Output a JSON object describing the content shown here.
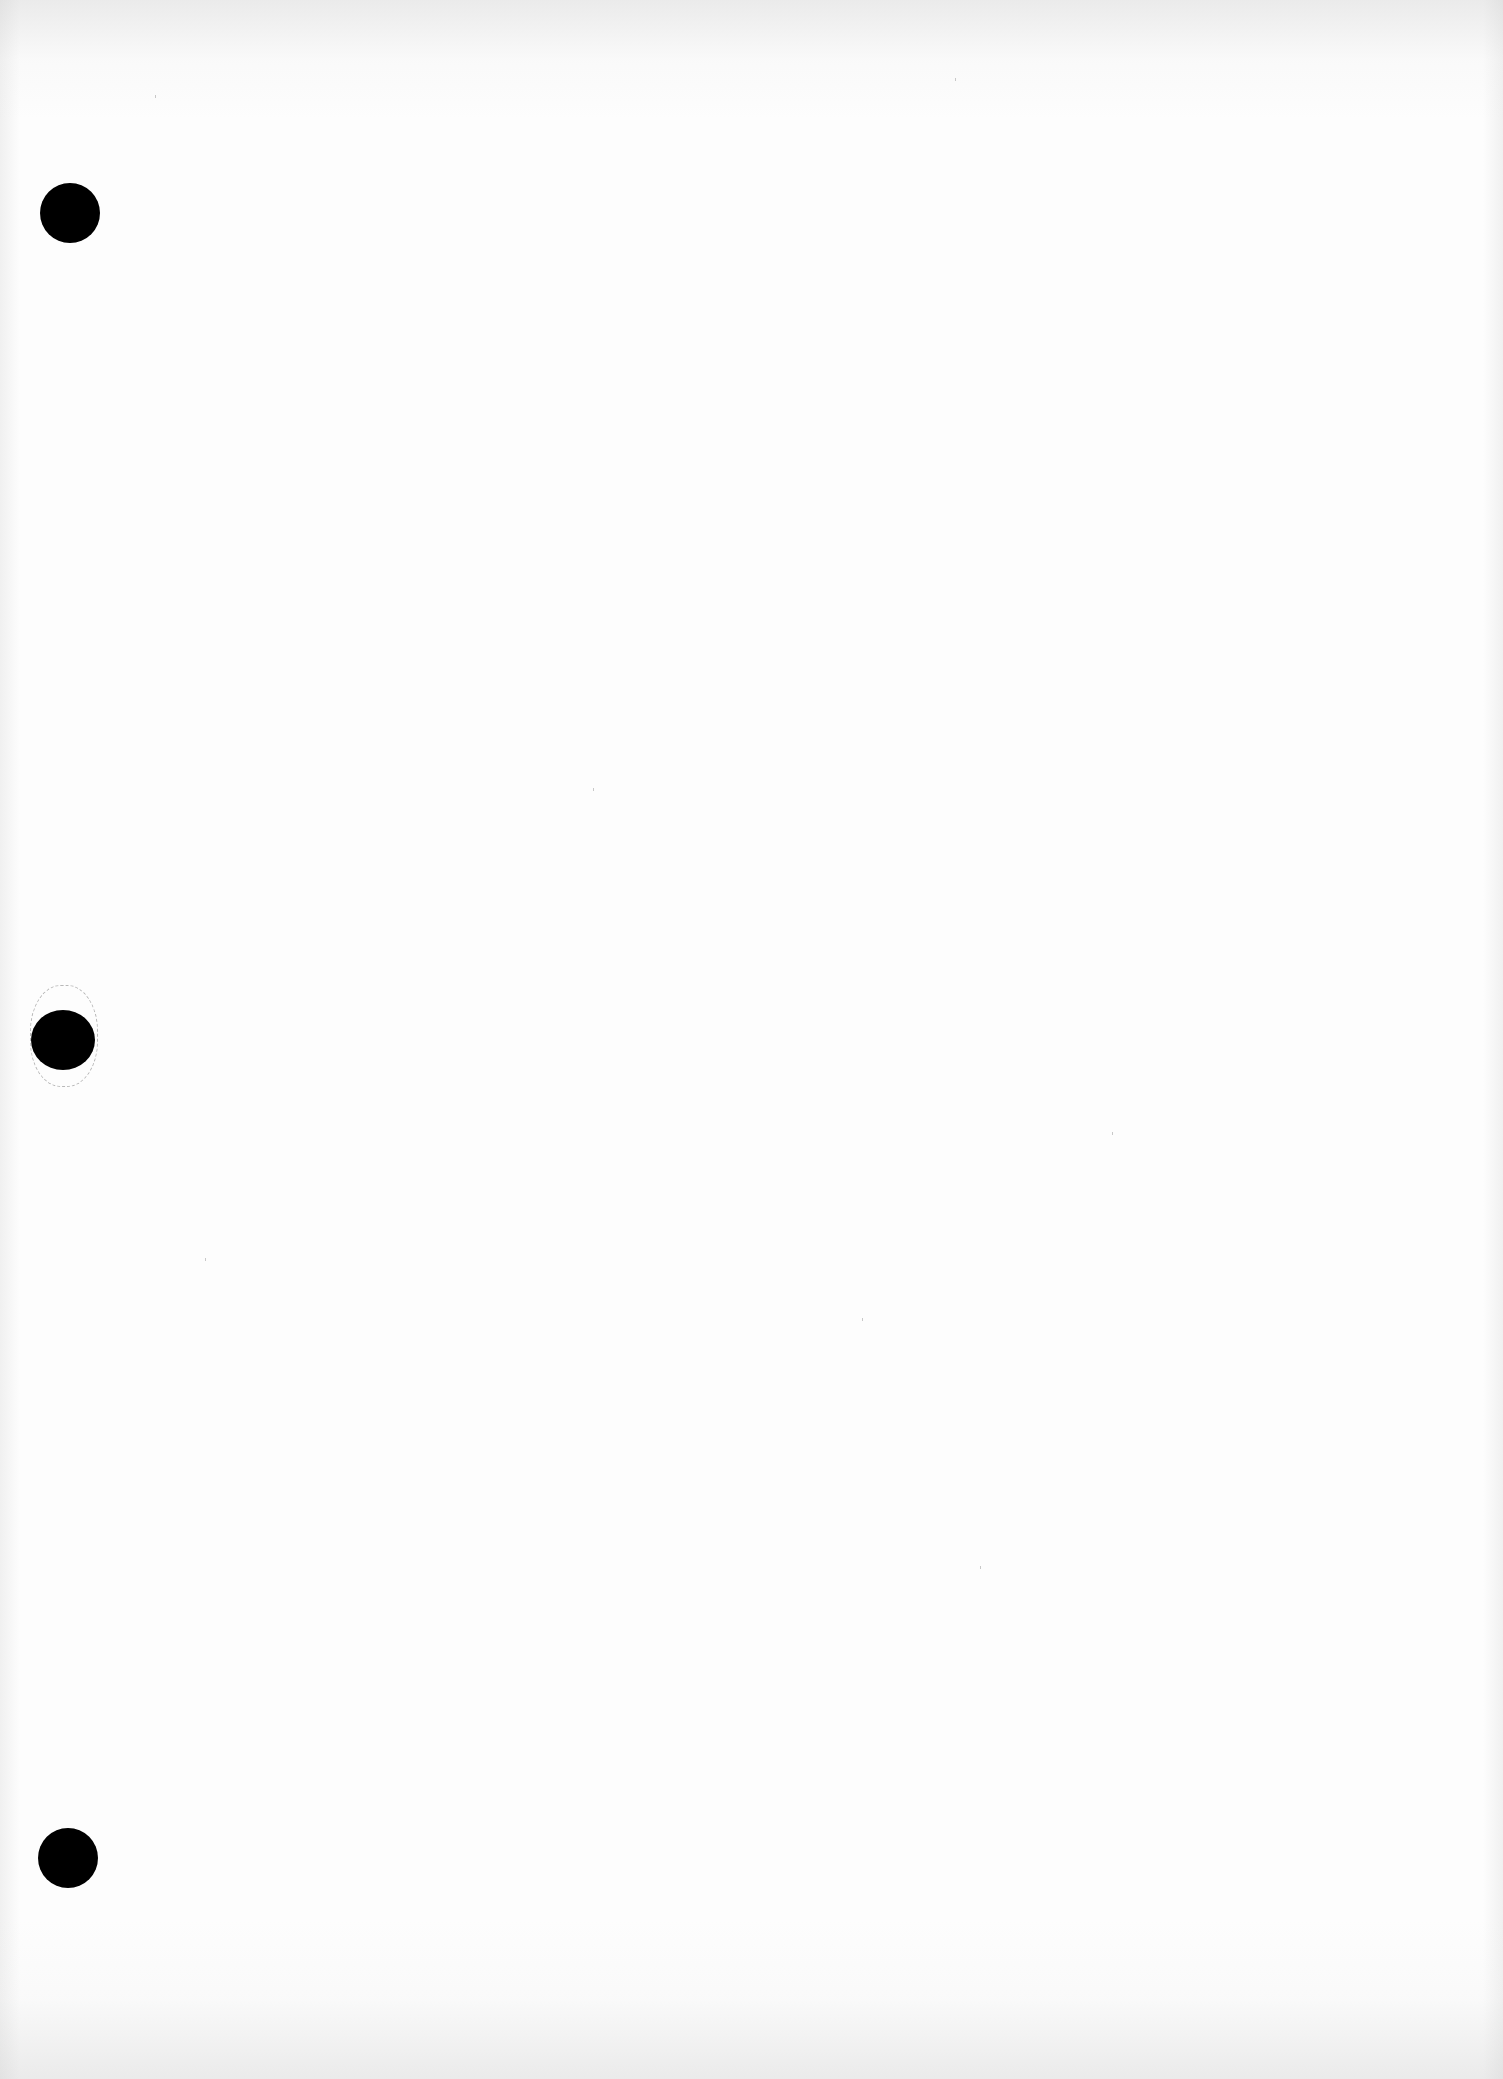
{
  "document": {
    "type": "blank scanned page",
    "text": "",
    "punch_holes": [
      {
        "id": "top",
        "cx": 70,
        "cy": 213,
        "rx": 30,
        "ry": 30
      },
      {
        "id": "middle",
        "cx": 63,
        "cy": 1040,
        "rx": 32,
        "ry": 30,
        "torn": true
      },
      {
        "id": "bottom",
        "cx": 68,
        "cy": 1858,
        "rx": 30,
        "ry": 30
      }
    ],
    "colors": {
      "paper": "#fdfdfd",
      "hole": "#000000",
      "edge_shadow": "#d0d0d0"
    }
  }
}
